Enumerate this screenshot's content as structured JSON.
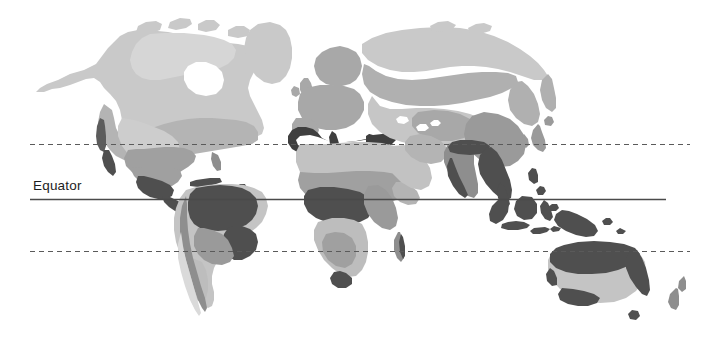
{
  "figure": {
    "type": "world-climate-zone-map",
    "projection": "equirectangular",
    "background_color": "#ffffff",
    "width": 704,
    "height": 337
  },
  "labels": {
    "equator": "Equator"
  },
  "reference_lines": [
    {
      "name": "tropic-of-cancer",
      "style": "dashed",
      "latitude": 23.5,
      "y": 144,
      "x_start": 30,
      "x_end": 690,
      "color": "#5a5a5a",
      "width": 1.2,
      "labeled": false
    },
    {
      "name": "equator",
      "style": "solid",
      "latitude": 0,
      "y": 199,
      "x_start": 30,
      "x_end": 666,
      "color": "#4a4a4a",
      "width": 1.4,
      "labeled": true
    },
    {
      "name": "tropic-of-capricorn",
      "style": "dashed",
      "latitude": -23.5,
      "y": 251,
      "x_start": 30,
      "x_end": 690,
      "color": "#5a5a5a",
      "width": 1.2,
      "labeled": false
    }
  ],
  "palette": {
    "zone_darkest": "#4f4f4f",
    "zone_dark": "#8e8e8e",
    "zone_medium": "#a8a8a8",
    "zone_light": "#bdbdbd",
    "zone_lightest": "#d2d2d2",
    "ocean": "#ffffff",
    "line_solid": "#4a4a4a",
    "line_dashed": "#5a5a5a",
    "text": "#1d1d1d"
  },
  "zone_legend": [
    {
      "key": "zone_darkest",
      "color": "#4f4f4f",
      "name": "tropical-rainforest"
    },
    {
      "key": "zone_dark",
      "color": "#8e8e8e",
      "name": "temperate-humid"
    },
    {
      "key": "zone_medium",
      "color": "#a8a8a8",
      "name": "continental"
    },
    {
      "key": "zone_light",
      "color": "#bdbdbd",
      "name": "arid-semiarid"
    },
    {
      "key": "zone_lightest",
      "color": "#d2d2d2",
      "name": "polar-subpolar"
    }
  ],
  "landmasses": [
    {
      "name": "north-america",
      "zones": [
        "zone_lightest",
        "zone_light",
        "zone_medium",
        "zone_dark",
        "zone_darkest"
      ]
    },
    {
      "name": "greenland",
      "zones": [
        "zone_lightest"
      ]
    },
    {
      "name": "south-america",
      "zones": [
        "zone_darkest",
        "zone_medium",
        "zone_light",
        "zone_lightest"
      ]
    },
    {
      "name": "europe",
      "zones": [
        "zone_medium",
        "zone_dark",
        "zone_darkest"
      ]
    },
    {
      "name": "africa",
      "zones": [
        "zone_light",
        "zone_medium",
        "zone_dark",
        "zone_darkest"
      ]
    },
    {
      "name": "asia",
      "zones": [
        "zone_lightest",
        "zone_light",
        "zone_medium",
        "zone_dark",
        "zone_darkest"
      ]
    },
    {
      "name": "india",
      "zones": [
        "zone_dark",
        "zone_darkest"
      ]
    },
    {
      "name": "southeast-asia",
      "zones": [
        "zone_darkest"
      ]
    },
    {
      "name": "indonesia",
      "zones": [
        "zone_darkest"
      ]
    },
    {
      "name": "new-guinea",
      "zones": [
        "zone_darkest"
      ]
    },
    {
      "name": "australia",
      "zones": [
        "zone_light",
        "zone_medium",
        "zone_darkest"
      ]
    },
    {
      "name": "new-zealand",
      "zones": [
        "zone_medium"
      ]
    },
    {
      "name": "madagascar",
      "zones": [
        "zone_medium",
        "zone_darkest"
      ]
    },
    {
      "name": "japan",
      "zones": [
        "zone_medium"
      ]
    },
    {
      "name": "british-isles",
      "zones": [
        "zone_medium"
      ]
    }
  ]
}
